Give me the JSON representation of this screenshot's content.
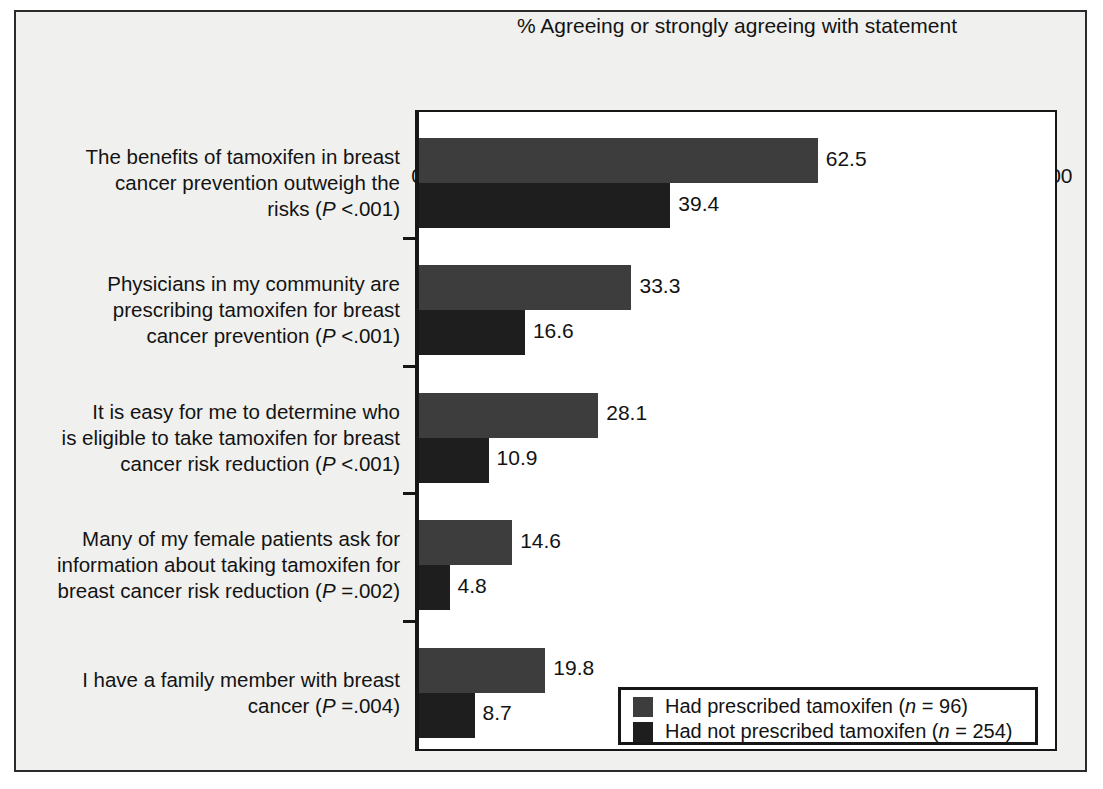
{
  "figure": {
    "background_color": "#f0f0ee",
    "plot_background_color": "#ffffff",
    "frame_color": "#2b2b2b"
  },
  "chart_data": {
    "type": "bar",
    "orientation": "horizontal",
    "title": "",
    "xlabel": "% Agreeing or strongly agreeing with statement",
    "ylabel": "",
    "xlim": [
      0,
      100
    ],
    "xticks": [
      0,
      10,
      20,
      30,
      40,
      50,
      60,
      70,
      80,
      90,
      100
    ],
    "xtick_labels": [
      "0",
      "10",
      "20",
      "30",
      "40",
      "50",
      "60",
      "70",
      "80",
      "90",
      "100"
    ],
    "grid": false,
    "legend_position": "lower right (inside plot)",
    "categories": [
      "The benefits of tamoxifen in breast cancer prevention outweigh the risks (P <.001)",
      "Physicians in my community are prescribing tamoxifen for breast cancer prevention (P <.001)",
      "It is easy for me to determine who is eligible to take tamoxifen for breast cancer risk reduction (P <.001)",
      "Many of my female patients ask for information about taking tamoxifen for breast cancer risk reduction (P =.002)",
      "I have a family member with breast cancer (P =.004)"
    ],
    "series": [
      {
        "name": "Had prescribed tamoxifen (n = 96)",
        "color": "#3d3d3d",
        "values": [
          62.5,
          33.3,
          28.1,
          14.6,
          19.8
        ]
      },
      {
        "name": "Had not prescribed tamoxifen (n = 254)",
        "color": "#1e1e1e",
        "values": [
          39.4,
          16.6,
          10.9,
          4.8,
          8.7
        ]
      }
    ]
  },
  "axis": {
    "title": "% Agreeing or strongly agreeing with statement"
  },
  "categories_display": [
    {
      "lines": [
        "The benefits of tamoxifen in breast",
        "cancer prevention outweigh the",
        "risks (P <.001)"
      ],
      "stat_prefix_3": "risks (",
      "stat_italic_3": "P",
      "stat_suffix_3": " <.001)"
    },
    {
      "lines": [
        "Physicians in my community are",
        "prescribing tamoxifen for breast",
        "cancer prevention (P <.001)"
      ]
    },
    {
      "lines": [
        "It is easy for me to determine who",
        "is eligible to take tamoxifen for breast",
        "cancer risk reduction (P <.001)"
      ]
    },
    {
      "lines": [
        "Many of my female patients ask for",
        "information about taking tamoxifen for",
        "breast cancer risk reduction (P =.002)"
      ]
    },
    {
      "lines": [
        "I have a family member with breast",
        "cancer (P =.004)"
      ]
    }
  ],
  "category_label_parts": [
    {
      "l1": "The benefits of tamoxifen in breast",
      "l2": "cancer prevention outweigh the",
      "l3a": "risks (",
      "l3i": "P",
      "l3b": " <.001)"
    },
    {
      "l1": "Physicians in my community are",
      "l2": "prescribing tamoxifen for breast",
      "l3a": "cancer prevention (",
      "l3i": "P",
      "l3b": " <.001)"
    },
    {
      "l1": "It is easy for me to determine who",
      "l2": "is eligible to take tamoxifen for breast",
      "l3a": "cancer risk reduction (",
      "l3i": "P",
      "l3b": " <.001)"
    },
    {
      "l1": "Many of my female patients ask for",
      "l2": "information about taking tamoxifen for",
      "l3a": "breast cancer risk reduction (",
      "l3i": "P",
      "l3b": " =.002)"
    },
    {
      "l1": "I have a family member with breast",
      "l2": "",
      "l3a": "cancer (",
      "l3i": "P",
      "l3b": " =.004)"
    }
  ],
  "bar_value_labels": [
    {
      "s0": "62.5",
      "s1": "39.4"
    },
    {
      "s0": "33.3",
      "s1": "16.6"
    },
    {
      "s0": "28.1",
      "s1": "10.9"
    },
    {
      "s0": "14.6",
      "s1": "4.8"
    },
    {
      "s0": "19.8",
      "s1": "8.7"
    }
  ],
  "legend": {
    "items": [
      {
        "prefix": "Had prescribed tamoxifen (",
        "italic": "n",
        "suffix": " = 96)",
        "color": "#3d3d3d"
      },
      {
        "prefix": "Had not prescribed tamoxifen (",
        "italic": "n",
        "suffix": " = 254)",
        "color": "#1e1e1e"
      }
    ]
  }
}
